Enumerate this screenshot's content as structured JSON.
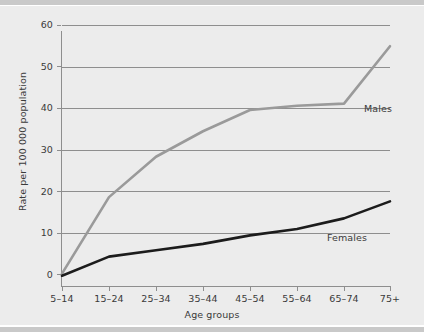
{
  "chart_data": {
    "type": "line",
    "title": "",
    "subtitle": "",
    "xlabel": "Age groups",
    "ylabel": "Rate per 100 000 population",
    "categories": [
      "5–14",
      "15–24",
      "25–34",
      "35–44",
      "45–54",
      "55–64",
      "65–74",
      "75+"
    ],
    "ylim": [
      0,
      60
    ],
    "yticks": [
      0,
      10,
      20,
      30,
      40,
      50,
      60
    ],
    "ytick_labels": [
      "0",
      "10",
      "20",
      "30",
      "40",
      "50",
      "60"
    ],
    "grid": "horizontal",
    "legend_position": "inline-annotation",
    "series": [
      {
        "name": "Males",
        "color": "#9a9a9a",
        "values": [
          1.5,
          19.5,
          29.0,
          35.0,
          40.0,
          41.0,
          41.5,
          55.0
        ],
        "label_x_px": 364,
        "label_y_px": 97
      },
      {
        "name": "Females",
        "color": "#1c1c1c",
        "values": [
          1.0,
          5.5,
          7.0,
          8.5,
          10.5,
          12.0,
          14.5,
          18.5
        ],
        "label_x_px": 327,
        "label_y_px": 226
      }
    ],
    "annotations": [
      "Males",
      "Females"
    ]
  },
  "colors": {
    "panel_background": "#ececec",
    "edge_band": "#c9c9c9",
    "grid": "#8e8e8e",
    "axis": "#8e8e8e",
    "text": "#3a3a3a",
    "males_line": "#9a9a9a",
    "females_line": "#1c1c1c"
  }
}
